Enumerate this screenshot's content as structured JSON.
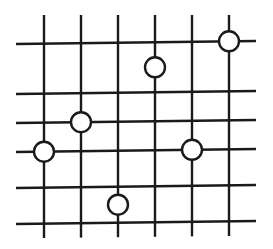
{
  "diagram": {
    "title": "",
    "grid": {
      "columns": 6,
      "rows": 6,
      "description": "6 vertical lines crossing 6 horizontal lines forming a lattice"
    },
    "nodes": [
      {
        "id": "node-1",
        "column": 6,
        "row": 1,
        "placement": "on-intersection"
      },
      {
        "id": "node-2",
        "column": 4,
        "row": 1.5,
        "placement": "on-vertical-between-rows"
      },
      {
        "id": "node-3",
        "column": 2,
        "row": 3,
        "placement": "on-intersection"
      },
      {
        "id": "node-4",
        "column": 1,
        "row": 4,
        "placement": "on-intersection"
      },
      {
        "id": "node-5",
        "column": 5,
        "row": 4,
        "placement": "on-intersection"
      },
      {
        "id": "node-6",
        "column": 3,
        "row": 5.5,
        "placement": "on-vertical-between-rows"
      }
    ],
    "colors": {
      "line": "#1a1a1a",
      "node_fill": "#ffffff",
      "background": "#ffffff"
    }
  }
}
